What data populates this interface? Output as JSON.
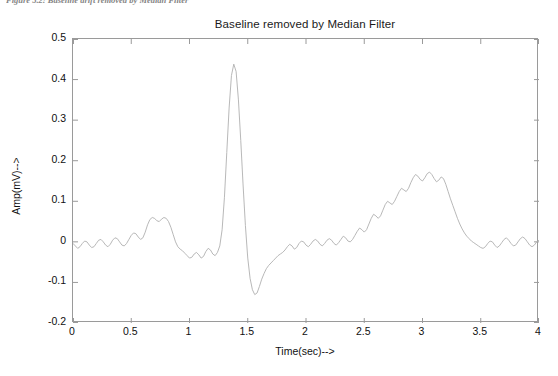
{
  "caption": {
    "text": "Figure 5.2: Baseline drift removed by Median Filter"
  },
  "chart_data": {
    "type": "line",
    "title": "Baseline removed by Median Filter",
    "xlabel": "Time(sec)-->",
    "ylabel": "Amp(mV)-->",
    "xlim": [
      0,
      4
    ],
    "ylim": [
      -0.2,
      0.5
    ],
    "xticks": [
      "0",
      "0.5",
      "1",
      "1.5",
      "2",
      "2.5",
      "3",
      "3.5",
      "4"
    ],
    "xtick_values": [
      0,
      0.5,
      1,
      1.5,
      2,
      2.5,
      3,
      3.5,
      4
    ],
    "yticks": [
      "0.5",
      "0.4",
      "0.3",
      "0.2",
      "0.1",
      "0",
      "-0.1",
      "-0.2"
    ],
    "ytick_values": [
      0.5,
      0.4,
      0.3,
      0.2,
      0.1,
      0,
      -0.1,
      -0.2
    ],
    "grid": false,
    "legend": null,
    "line_color": "#b0b0b0",
    "line_width": 0.9,
    "series": [
      {
        "name": "ECG baseline removed",
        "x": [
          0.0,
          0.02,
          0.04,
          0.06,
          0.08,
          0.1,
          0.12,
          0.14,
          0.16,
          0.18,
          0.2,
          0.22,
          0.24,
          0.26,
          0.28,
          0.3,
          0.32,
          0.34,
          0.36,
          0.38,
          0.4,
          0.42,
          0.44,
          0.46,
          0.48,
          0.5,
          0.52,
          0.54,
          0.56,
          0.58,
          0.6,
          0.62,
          0.64,
          0.66,
          0.68,
          0.7,
          0.72,
          0.74,
          0.76,
          0.78,
          0.8,
          0.82,
          0.84,
          0.86,
          0.88,
          0.9,
          0.92,
          0.94,
          0.96,
          0.98,
          1.0,
          1.02,
          1.04,
          1.06,
          1.08,
          1.1,
          1.12,
          1.14,
          1.16,
          1.18,
          1.2,
          1.22,
          1.24,
          1.26,
          1.28,
          1.3,
          1.32,
          1.34,
          1.36,
          1.38,
          1.4,
          1.42,
          1.44,
          1.46,
          1.48,
          1.5,
          1.52,
          1.54,
          1.56,
          1.58,
          1.6,
          1.62,
          1.64,
          1.66,
          1.68,
          1.7,
          1.72,
          1.74,
          1.76,
          1.78,
          1.8,
          1.82,
          1.84,
          1.86,
          1.88,
          1.9,
          1.92,
          1.94,
          1.96,
          1.98,
          2.0,
          2.02,
          2.04,
          2.06,
          2.08,
          2.1,
          2.12,
          2.14,
          2.16,
          2.18,
          2.2,
          2.22,
          2.24,
          2.26,
          2.28,
          2.3,
          2.32,
          2.34,
          2.36,
          2.38,
          2.4,
          2.42,
          2.44,
          2.46,
          2.48,
          2.5,
          2.52,
          2.54,
          2.56,
          2.58,
          2.6,
          2.62,
          2.64,
          2.66,
          2.68,
          2.7,
          2.72,
          2.74,
          2.76,
          2.78,
          2.8,
          2.82,
          2.84,
          2.86,
          2.88,
          2.9,
          2.92,
          2.94,
          2.96,
          2.98,
          3.0,
          3.02,
          3.04,
          3.06,
          3.08,
          3.1,
          3.12,
          3.14,
          3.16,
          3.18,
          3.2,
          3.22,
          3.24,
          3.26,
          3.28,
          3.3,
          3.32,
          3.34,
          3.36,
          3.38,
          3.4,
          3.42,
          3.44,
          3.46,
          3.48,
          3.5,
          3.52,
          3.54,
          3.56,
          3.58,
          3.6,
          3.62,
          3.64,
          3.66,
          3.68,
          3.7,
          3.72,
          3.74,
          3.76,
          3.78,
          3.8,
          3.82,
          3.84,
          3.86,
          3.88,
          3.9,
          3.92,
          3.94,
          3.96,
          3.98,
          4.0
        ],
        "y": [
          -0.004,
          -0.01,
          -0.016,
          -0.012,
          -0.004,
          0.002,
          0.0,
          -0.008,
          -0.014,
          -0.012,
          -0.004,
          0.004,
          0.006,
          0.0,
          -0.008,
          -0.012,
          -0.006,
          0.004,
          0.01,
          0.008,
          0.0,
          -0.008,
          -0.01,
          -0.004,
          0.006,
          0.016,
          0.022,
          0.02,
          0.012,
          0.006,
          0.01,
          0.024,
          0.042,
          0.055,
          0.06,
          0.058,
          0.052,
          0.05,
          0.056,
          0.06,
          0.058,
          0.05,
          0.036,
          0.018,
          0.0,
          -0.012,
          -0.018,
          -0.022,
          -0.028,
          -0.034,
          -0.04,
          -0.038,
          -0.03,
          -0.026,
          -0.032,
          -0.04,
          -0.036,
          -0.024,
          -0.016,
          -0.02,
          -0.03,
          -0.034,
          -0.026,
          -0.01,
          0.03,
          0.11,
          0.22,
          0.33,
          0.41,
          0.438,
          0.42,
          0.35,
          0.25,
          0.14,
          0.04,
          -0.04,
          -0.09,
          -0.118,
          -0.13,
          -0.126,
          -0.11,
          -0.092,
          -0.078,
          -0.066,
          -0.058,
          -0.052,
          -0.046,
          -0.04,
          -0.034,
          -0.03,
          -0.026,
          -0.02,
          -0.012,
          -0.006,
          -0.01,
          -0.018,
          -0.014,
          -0.004,
          0.002,
          0.0,
          -0.008,
          -0.012,
          -0.006,
          0.002,
          0.006,
          0.002,
          -0.006,
          -0.01,
          -0.004,
          0.004,
          0.008,
          0.004,
          -0.004,
          -0.008,
          -0.002,
          0.006,
          0.014,
          0.01,
          0.002,
          0.0,
          0.006,
          0.016,
          0.026,
          0.034,
          0.03,
          0.024,
          0.03,
          0.044,
          0.058,
          0.068,
          0.064,
          0.058,
          0.064,
          0.078,
          0.092,
          0.1,
          0.096,
          0.092,
          0.1,
          0.112,
          0.124,
          0.132,
          0.128,
          0.124,
          0.132,
          0.146,
          0.158,
          0.166,
          0.162,
          0.154,
          0.15,
          0.158,
          0.168,
          0.172,
          0.166,
          0.156,
          0.148,
          0.152,
          0.16,
          0.156,
          0.142,
          0.124,
          0.106,
          0.09,
          0.074,
          0.058,
          0.044,
          0.032,
          0.022,
          0.014,
          0.008,
          0.002,
          -0.002,
          -0.006,
          -0.01,
          -0.014,
          -0.016,
          -0.012,
          -0.004,
          0.002,
          0.0,
          -0.008,
          -0.014,
          -0.01,
          -0.002,
          0.006,
          0.01,
          0.004,
          -0.004,
          -0.01,
          -0.008,
          0.0,
          0.008,
          0.012,
          0.008,
          0.0,
          -0.008,
          -0.012,
          -0.008,
          0.0,
          0.004
        ]
      }
    ],
    "annotations": {
      "r_peak_amplitude": 0.44,
      "r_peak_time": 1.1,
      "s_trough_amplitude": -0.13,
      "s_trough_time": 1.24,
      "p_wave_amplitude": 0.06,
      "p_wave_time": 0.68,
      "t_wave_amplitude": 0.17,
      "t_wave_time": 2.42
    }
  }
}
